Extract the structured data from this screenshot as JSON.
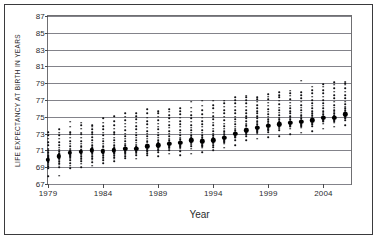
{
  "chart_data": {
    "type": "scatter",
    "title": "",
    "xlabel": "Year",
    "ylabel": "LIFE EXPECTANCY AT BIRTH IN YEARS",
    "xlim": [
      1979,
      2006.5
    ],
    "ylim": [
      67,
      87
    ],
    "y_ticks": [
      67,
      69,
      71,
      73,
      75,
      77,
      79,
      81,
      83,
      85,
      87
    ],
    "x_ticks": [
      1979,
      1984,
      1989,
      1994,
      1999,
      2004
    ],
    "grid": "horizontal",
    "legend": "none",
    "marker_note": "small dots = individual observations per year; large dot = mean",
    "series": [
      {
        "name": "Mean life expectancy",
        "marker": "large-dot",
        "x": [
          1979,
          1980,
          1981,
          1982,
          1983,
          1984,
          1985,
          1986,
          1987,
          1988,
          1989,
          1990,
          1991,
          1992,
          1993,
          1994,
          1995,
          1996,
          1997,
          1998,
          1999,
          2000,
          2001,
          2002,
          2003,
          2004,
          2005,
          2006
        ],
        "values": [
          69.9,
          70.3,
          70.7,
          70.8,
          71.0,
          70.9,
          71.0,
          71.2,
          71.2,
          71.5,
          71.6,
          71.8,
          71.9,
          72.2,
          72.1,
          72.2,
          72.5,
          73.0,
          73.4,
          73.7,
          73.9,
          74.1,
          74.3,
          74.4,
          74.6,
          74.9,
          74.9,
          75.3
        ]
      },
      {
        "name": "Observations per year (min)",
        "marker": "small-dot",
        "x": [
          1979,
          1980,
          1981,
          1982,
          1983,
          1984,
          1985,
          1986,
          1987,
          1988,
          1989,
          1990,
          1991,
          1992,
          1993,
          1994,
          1995,
          1996,
          1997,
          1998,
          1999,
          2000,
          2001,
          2002,
          2003,
          2004,
          2005,
          2006
        ],
        "values": [
          67.9,
          68.0,
          68.9,
          69.0,
          69.2,
          69.5,
          69.7,
          70.1,
          70.0,
          70.4,
          70.3,
          70.6,
          70.4,
          70.6,
          70.8,
          71.0,
          71.3,
          71.6,
          72.2,
          72.4,
          72.6,
          72.7,
          72.9,
          73.1,
          73.3,
          73.6,
          73.8,
          74.0
        ]
      },
      {
        "name": "Observations per year (max)",
        "marker": "small-dot",
        "x": [
          1979,
          1980,
          1981,
          1982,
          1983,
          1984,
          1985,
          1986,
          1987,
          1988,
          1989,
          1990,
          1991,
          1992,
          1993,
          1994,
          1995,
          1996,
          1997,
          1998,
          1999,
          2000,
          2001,
          2002,
          2003,
          2004,
          2005,
          2006
        ],
        "values": [
          73.2,
          73.5,
          74.4,
          74.3,
          74.0,
          74.8,
          75.1,
          75.4,
          75.4,
          75.9,
          75.7,
          75.9,
          76.0,
          76.8,
          76.9,
          76.9,
          76.9,
          77.3,
          77.5,
          77.3,
          77.7,
          77.9,
          78.1,
          79.3,
          78.6,
          78.9,
          79.1,
          79.2
        ]
      }
    ],
    "strips": [
      {
        "year": 1979,
        "mean": 69.9,
        "points": [
          67.9,
          68.9,
          69.1,
          69.3,
          69.4,
          69.6,
          69.7,
          69.8,
          69.9,
          70.0,
          70.1,
          70.2,
          70.3,
          70.4,
          70.6,
          70.8,
          71.0,
          71.2,
          71.6,
          72.0,
          72.4,
          72.8,
          73.2
        ]
      },
      {
        "year": 1980,
        "mean": 70.3,
        "points": [
          68.0,
          69.0,
          69.3,
          69.5,
          69.7,
          69.9,
          70.0,
          70.1,
          70.2,
          70.3,
          70.4,
          70.5,
          70.6,
          70.7,
          70.9,
          71.1,
          71.3,
          71.6,
          72.0,
          72.4,
          72.8,
          73.1,
          73.5
        ]
      },
      {
        "year": 1981,
        "mean": 70.7,
        "points": [
          68.9,
          69.2,
          69.5,
          69.8,
          70.0,
          70.2,
          70.3,
          70.4,
          70.5,
          70.6,
          70.7,
          70.8,
          70.9,
          71.0,
          71.2,
          71.5,
          71.8,
          72.1,
          72.5,
          72.9,
          73.2,
          73.8,
          74.4
        ]
      },
      {
        "year": 1982,
        "mean": 70.8,
        "points": [
          69.0,
          69.4,
          69.7,
          69.9,
          70.1,
          70.3,
          70.5,
          70.6,
          70.7,
          70.8,
          70.9,
          71.0,
          71.1,
          71.3,
          71.5,
          71.8,
          72.1,
          72.5,
          72.9,
          73.1,
          73.6,
          74.0,
          74.3
        ]
      },
      {
        "year": 1983,
        "mean": 71.0,
        "points": [
          69.2,
          69.6,
          69.9,
          70.1,
          70.3,
          70.5,
          70.7,
          70.8,
          70.9,
          71.0,
          71.1,
          71.2,
          71.4,
          71.6,
          71.9,
          72.2,
          72.6,
          72.9,
          73.2,
          73.5,
          73.8,
          74.0
        ]
      },
      {
        "year": 1984,
        "mean": 70.9,
        "points": [
          69.5,
          69.8,
          70.0,
          70.2,
          70.4,
          70.6,
          70.7,
          70.8,
          70.9,
          71.0,
          71.1,
          71.3,
          71.5,
          71.8,
          72.1,
          72.4,
          72.8,
          73.1,
          73.5,
          73.9,
          74.3,
          74.8
        ]
      },
      {
        "year": 1985,
        "mean": 71.0,
        "points": [
          69.7,
          70.0,
          70.2,
          70.4,
          70.6,
          70.7,
          70.8,
          70.9,
          71.0,
          71.1,
          71.2,
          71.4,
          71.6,
          71.9,
          72.2,
          72.5,
          72.9,
          73.2,
          73.6,
          74.0,
          74.5,
          75.1
        ]
      },
      {
        "year": 1986,
        "mean": 71.2,
        "points": [
          70.1,
          70.3,
          70.5,
          70.7,
          70.8,
          70.9,
          71.0,
          71.1,
          71.2,
          71.3,
          71.4,
          71.6,
          71.8,
          72.1,
          72.4,
          72.7,
          73.0,
          73.4,
          73.8,
          74.2,
          74.6,
          75.0,
          75.4
        ]
      },
      {
        "year": 1987,
        "mean": 71.2,
        "points": [
          70.0,
          70.4,
          70.6,
          70.8,
          70.9,
          71.0,
          71.1,
          71.2,
          71.3,
          71.4,
          71.5,
          71.7,
          71.9,
          72.2,
          72.5,
          72.8,
          73.1,
          73.5,
          73.9,
          74.3,
          74.7,
          75.1,
          75.4
        ]
      },
      {
        "year": 1988,
        "mean": 71.5,
        "points": [
          70.4,
          70.7,
          70.9,
          71.0,
          71.1,
          71.2,
          71.3,
          71.4,
          71.5,
          71.6,
          71.7,
          71.9,
          72.1,
          72.4,
          72.7,
          73.0,
          73.3,
          73.7,
          74.1,
          74.5,
          74.9,
          75.4,
          75.9
        ]
      },
      {
        "year": 1989,
        "mean": 71.6,
        "points": [
          70.3,
          70.8,
          71.0,
          71.1,
          71.2,
          71.3,
          71.4,
          71.5,
          71.6,
          71.7,
          71.8,
          72.0,
          72.2,
          72.5,
          72.8,
          73.1,
          73.5,
          73.8,
          74.2,
          74.6,
          75.0,
          75.4,
          75.7
        ]
      },
      {
        "year": 1990,
        "mean": 71.8,
        "points": [
          70.6,
          71.0,
          71.2,
          71.3,
          71.4,
          71.5,
          71.6,
          71.7,
          71.8,
          71.9,
          72.0,
          72.2,
          72.4,
          72.7,
          73.0,
          73.3,
          73.7,
          74.0,
          74.4,
          74.8,
          75.2,
          75.6,
          75.9
        ]
      },
      {
        "year": 1991,
        "mean": 71.9,
        "points": [
          70.4,
          70.9,
          71.2,
          71.4,
          71.5,
          71.6,
          71.7,
          71.8,
          71.9,
          72.0,
          72.1,
          72.3,
          72.5,
          72.8,
          73.1,
          73.4,
          73.8,
          74.1,
          74.5,
          74.9,
          75.3,
          75.7,
          76.0
        ]
      },
      {
        "year": 1992,
        "mean": 72.2,
        "points": [
          70.6,
          71.2,
          71.5,
          71.7,
          71.8,
          71.9,
          72.0,
          72.1,
          72.2,
          72.3,
          72.4,
          72.6,
          72.8,
          73.1,
          73.4,
          73.7,
          74.0,
          74.4,
          74.8,
          75.2,
          75.6,
          76.1,
          76.8
        ]
      },
      {
        "year": 1993,
        "mean": 72.1,
        "points": [
          70.8,
          71.3,
          71.5,
          71.6,
          71.7,
          71.8,
          71.9,
          72.0,
          72.1,
          72.2,
          72.4,
          72.6,
          72.8,
          73.1,
          73.4,
          73.8,
          74.1,
          74.5,
          74.9,
          75.3,
          75.8,
          76.3,
          76.9
        ]
      },
      {
        "year": 1994,
        "mean": 72.2,
        "points": [
          71.0,
          71.4,
          71.6,
          71.8,
          71.9,
          72.0,
          72.1,
          72.2,
          72.3,
          72.4,
          72.6,
          72.8,
          73.0,
          73.3,
          73.6,
          74.0,
          74.3,
          74.7,
          75.1,
          75.5,
          76.0,
          76.4,
          76.9
        ]
      },
      {
        "year": 1995,
        "mean": 72.5,
        "points": [
          71.3,
          71.8,
          72.0,
          72.1,
          72.2,
          72.3,
          72.4,
          72.5,
          72.6,
          72.7,
          72.9,
          73.1,
          73.3,
          73.6,
          73.9,
          74.2,
          74.6,
          75.0,
          75.4,
          75.8,
          76.2,
          76.6,
          76.9
        ]
      },
      {
        "year": 1996,
        "mean": 73.0,
        "points": [
          71.6,
          72.2,
          72.5,
          72.6,
          72.7,
          72.8,
          72.9,
          73.0,
          73.1,
          73.2,
          73.4,
          73.6,
          73.8,
          74.1,
          74.4,
          74.7,
          75.0,
          75.4,
          75.8,
          76.2,
          76.6,
          77.0,
          77.3
        ]
      },
      {
        "year": 1997,
        "mean": 73.4,
        "points": [
          72.2,
          72.7,
          72.9,
          73.0,
          73.1,
          73.2,
          73.3,
          73.4,
          73.5,
          73.6,
          73.8,
          74.0,
          74.2,
          74.5,
          74.8,
          75.1,
          75.4,
          75.8,
          76.2,
          76.6,
          77.0,
          77.3,
          77.5
        ]
      },
      {
        "year": 1998,
        "mean": 73.7,
        "points": [
          72.4,
          73.0,
          73.2,
          73.3,
          73.4,
          73.5,
          73.6,
          73.7,
          73.8,
          73.9,
          74.1,
          74.3,
          74.5,
          74.8,
          75.1,
          75.4,
          75.7,
          76.0,
          76.4,
          76.8,
          77.1,
          77.3
        ]
      },
      {
        "year": 1999,
        "mean": 73.9,
        "points": [
          72.6,
          73.2,
          73.4,
          73.5,
          73.6,
          73.7,
          73.8,
          73.9,
          74.0,
          74.1,
          74.3,
          74.5,
          74.7,
          75.0,
          75.3,
          75.6,
          75.9,
          76.3,
          76.7,
          77.1,
          77.4,
          77.7
        ]
      },
      {
        "year": 2000,
        "mean": 74.1,
        "points": [
          72.7,
          73.4,
          73.6,
          73.7,
          73.8,
          73.9,
          74.0,
          74.1,
          74.2,
          74.3,
          74.5,
          74.7,
          74.9,
          75.2,
          75.5,
          75.8,
          76.1,
          76.5,
          76.9,
          77.3,
          77.6,
          77.9
        ]
      },
      {
        "year": 2001,
        "mean": 74.3,
        "points": [
          72.9,
          73.6,
          73.8,
          73.9,
          74.0,
          74.1,
          74.2,
          74.3,
          74.4,
          74.5,
          74.7,
          74.9,
          75.1,
          75.4,
          75.7,
          76.0,
          76.3,
          76.7,
          77.1,
          77.5,
          77.8,
          78.1
        ]
      },
      {
        "year": 2002,
        "mean": 74.4,
        "points": [
          73.1,
          73.7,
          73.9,
          74.0,
          74.1,
          74.2,
          74.3,
          74.4,
          74.5,
          74.6,
          74.8,
          75.0,
          75.2,
          75.5,
          75.8,
          76.1,
          76.4,
          76.8,
          77.2,
          77.6,
          77.9,
          79.3
        ]
      },
      {
        "year": 2003,
        "mean": 74.6,
        "points": [
          73.3,
          73.9,
          74.1,
          74.2,
          74.3,
          74.4,
          74.5,
          74.6,
          74.7,
          74.8,
          75.0,
          75.2,
          75.4,
          75.7,
          76.0,
          76.3,
          76.6,
          77.0,
          77.4,
          77.8,
          78.2,
          78.6
        ]
      },
      {
        "year": 2004,
        "mean": 74.9,
        "points": [
          73.6,
          74.2,
          74.4,
          74.5,
          74.6,
          74.7,
          74.8,
          74.9,
          75.0,
          75.1,
          75.3,
          75.5,
          75.7,
          76.0,
          76.3,
          76.6,
          77.0,
          77.4,
          77.8,
          78.2,
          78.6,
          78.9
        ]
      },
      {
        "year": 2005,
        "mean": 74.9,
        "points": [
          73.8,
          74.3,
          74.5,
          74.6,
          74.7,
          74.8,
          74.9,
          75.0,
          75.1,
          75.2,
          75.4,
          75.6,
          75.8,
          76.1,
          76.4,
          76.8,
          77.2,
          77.6,
          78.0,
          78.4,
          78.8,
          79.1
        ]
      },
      {
        "year": 2006,
        "mean": 75.3,
        "points": [
          74.0,
          74.6,
          74.8,
          74.9,
          75.0,
          75.1,
          75.2,
          75.3,
          75.4,
          75.6,
          75.8,
          76.0,
          76.2,
          76.5,
          76.8,
          77.2,
          77.6,
          78.0,
          78.4,
          78.8,
          79.0,
          79.2
        ]
      }
    ]
  }
}
